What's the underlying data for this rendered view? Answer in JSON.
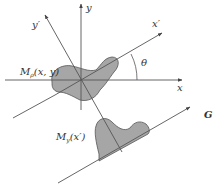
{
  "diagram": {
    "labels": {
      "x_axis": "x",
      "y_axis": "y",
      "x_prime_axis": "x′",
      "y_prime_axis": "y′",
      "angle": "θ",
      "projection_line": "G",
      "object_function": "M",
      "object_sub": "ρ",
      "object_args": "(x, y)",
      "projection_function": "M",
      "projection_sub": "y",
      "projection_args": "(x′)"
    },
    "colors": {
      "line": "#555555",
      "fill": "#a6a6a6",
      "text": "#333333",
      "background": "#ffffff"
    }
  }
}
